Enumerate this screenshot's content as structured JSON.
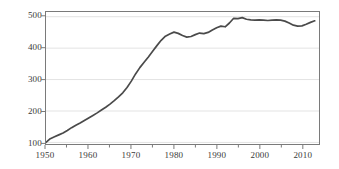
{
  "chart_data": {
    "type": "line",
    "title": "",
    "subtitle": "",
    "xlabel": "",
    "ylabel": "",
    "xlim": [
      1950,
      2014
    ],
    "ylim": [
      95,
      515
    ],
    "yticks": [
      100,
      200,
      300,
      400,
      500
    ],
    "xticks": [
      1950,
      1960,
      1970,
      1980,
      1990,
      2000,
      2010
    ],
    "xminor_step": 5,
    "grid": "horizontal",
    "legend": "none",
    "line_color": "#4a4a4a",
    "grid_color": "#e3e3e3",
    "axis_color": "#7a7a7a",
    "series": [
      {
        "name": "value",
        "x": [
          1950,
          1951,
          1952,
          1953,
          1954,
          1955,
          1956,
          1957,
          1958,
          1959,
          1960,
          1961,
          1962,
          1963,
          1964,
          1965,
          1966,
          1967,
          1968,
          1969,
          1970,
          1971,
          1972,
          1973,
          1974,
          1975,
          1976,
          1977,
          1978,
          1979,
          1980,
          1981,
          1982,
          1983,
          1984,
          1985,
          1986,
          1987,
          1988,
          1989,
          1990,
          1991,
          1992,
          1993,
          1994,
          1995,
          1996,
          1997,
          1998,
          1999,
          2000,
          2001,
          2002,
          2003,
          2004,
          2005,
          2006,
          2007,
          2008,
          2009,
          2010,
          2011,
          2012,
          2013
        ],
        "values": [
          100,
          112,
          118,
          124,
          130,
          138,
          147,
          155,
          162,
          170,
          178,
          186,
          194,
          203,
          212,
          222,
          233,
          245,
          258,
          275,
          295,
          318,
          338,
          355,
          372,
          390,
          408,
          425,
          438,
          445,
          451,
          447,
          440,
          435,
          437,
          443,
          448,
          446,
          450,
          458,
          465,
          470,
          468,
          480,
          495,
          494,
          497,
          492,
          490,
          489,
          490,
          489,
          488,
          489,
          490,
          489,
          486,
          480,
          473,
          470,
          471,
          476,
          482,
          487
        ]
      }
    ]
  }
}
